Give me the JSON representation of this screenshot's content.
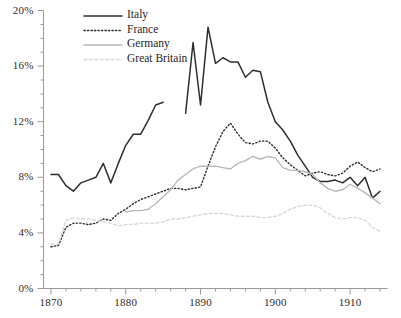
{
  "chart_data": {
    "type": "line",
    "title": "",
    "subtitle": "",
    "xlabel": "",
    "ylabel": "",
    "xlim": [
      1869,
      1915
    ],
    "ylim": [
      0,
      20
    ],
    "grid": false,
    "legend_position": "top-left",
    "y_ticks": [
      0,
      4,
      8,
      12,
      16,
      20
    ],
    "y_tick_labels": [
      "0%",
      "4%",
      "8%",
      "12%",
      "16%",
      "20%"
    ],
    "y_minor_step": 1,
    "x_ticks": [
      1870,
      1880,
      1890,
      1900,
      1910
    ],
    "x_tick_labels": [
      "1870",
      "1880",
      "1890",
      "1900",
      "1910"
    ],
    "x_minor_step": 2,
    "value_unit": "percent",
    "series": [
      {
        "name": "Italy",
        "color": "#2e2e2e",
        "style": "solid",
        "width": 1.5,
        "x": [
          1870,
          1871,
          1872,
          1873,
          1874,
          1875,
          1876,
          1877,
          1878,
          1879,
          1880,
          1881,
          1882,
          1883,
          1884,
          1885
        ],
        "values": [
          8.2,
          8.2,
          7.4,
          7.0,
          7.6,
          7.8,
          8.0,
          9.0,
          7.6,
          9.0,
          10.3,
          11.1,
          11.1,
          12.1,
          13.2,
          13.4
        ]
      },
      {
        "name": "Italy",
        "color": "#2e2e2e",
        "style": "solid",
        "width": 1.5,
        "segment": 2,
        "x": [
          1888,
          1889,
          1890,
          1891,
          1892,
          1893,
          1894,
          1895,
          1896,
          1897,
          1898,
          1899,
          1900,
          1901,
          1902,
          1903,
          1904,
          1905,
          1906,
          1907,
          1908,
          1909,
          1910,
          1911,
          1912,
          1913,
          1914
        ],
        "values": [
          12.6,
          17.7,
          13.2,
          18.8,
          16.2,
          16.6,
          16.3,
          16.3,
          15.2,
          15.7,
          15.6,
          13.4,
          12.0,
          11.4,
          10.6,
          9.6,
          8.8,
          8.0,
          7.7,
          7.7,
          7.8,
          7.6,
          8.0,
          7.4,
          8.0,
          6.5,
          7.0
        ]
      },
      {
        "name": "France",
        "color": "#2e2e2e",
        "style": "dotted",
        "width": 1.4,
        "x": [
          1870,
          1871,
          1872,
          1873,
          1874,
          1875,
          1876,
          1877,
          1878,
          1879,
          1880,
          1881,
          1882,
          1883,
          1884,
          1885,
          1886,
          1887,
          1888,
          1889,
          1890,
          1891,
          1892,
          1893,
          1894,
          1895,
          1896,
          1897,
          1898,
          1899,
          1900,
          1901,
          1902,
          1903,
          1904,
          1905,
          1906,
          1907,
          1908,
          1909,
          1910,
          1911,
          1912,
          1913,
          1914
        ],
        "values": [
          3.0,
          3.1,
          4.4,
          4.7,
          4.7,
          4.6,
          4.7,
          5.0,
          4.9,
          5.4,
          5.7,
          6.1,
          6.4,
          6.6,
          6.8,
          7.0,
          7.2,
          7.2,
          7.1,
          7.2,
          7.3,
          8.8,
          10.2,
          11.3,
          11.9,
          11.1,
          10.5,
          10.4,
          10.6,
          10.6,
          10.1,
          9.4,
          8.9,
          8.5,
          8.1,
          8.3,
          8.4,
          8.2,
          8.1,
          8.3,
          8.8,
          9.1,
          8.7,
          8.4,
          8.6
        ]
      },
      {
        "name": "Germany",
        "color": "#b9b9b9",
        "style": "solid",
        "width": 1.4,
        "x": [
          1880,
          1881,
          1882,
          1883,
          1884,
          1885,
          1886,
          1887,
          1888,
          1889,
          1890,
          1891,
          1892,
          1893,
          1894,
          1895,
          1896,
          1897,
          1898,
          1899,
          1900,
          1901,
          1902,
          1903,
          1904,
          1905,
          1906,
          1907,
          1908,
          1909,
          1910,
          1911,
          1912,
          1913,
          1914
        ],
        "values": [
          5.5,
          5.6,
          5.6,
          5.7,
          6.1,
          6.6,
          7.1,
          7.8,
          8.2,
          8.6,
          8.8,
          8.8,
          8.8,
          8.7,
          8.6,
          9.0,
          9.2,
          9.5,
          9.3,
          9.5,
          9.4,
          8.7,
          8.5,
          8.5,
          8.4,
          8.2,
          7.6,
          7.2,
          7.0,
          7.1,
          7.5,
          7.2,
          6.9,
          6.5,
          6.1
        ]
      },
      {
        "name": "Great Britain",
        "color": "#d9d9d9",
        "style": "dashed",
        "width": 1.4,
        "x": [
          1870,
          1871,
          1872,
          1873,
          1874,
          1875,
          1876,
          1877,
          1878,
          1879,
          1880,
          1881,
          1882,
          1883,
          1884,
          1885,
          1886,
          1887,
          1888,
          1889,
          1890,
          1891,
          1892,
          1893,
          1894,
          1895,
          1896,
          1897,
          1898,
          1899,
          1900,
          1901,
          1902,
          1903,
          1904,
          1905,
          1906,
          1907,
          1908,
          1909,
          1910,
          1911,
          1912,
          1913,
          1914
        ],
        "values": [
          3.2,
          3.2,
          4.9,
          5.1,
          5.0,
          5.0,
          4.9,
          4.8,
          4.7,
          4.5,
          4.6,
          4.6,
          4.7,
          4.7,
          4.7,
          4.8,
          5.0,
          5.0,
          5.1,
          5.2,
          5.3,
          5.4,
          5.4,
          5.4,
          5.3,
          5.2,
          5.2,
          5.2,
          5.1,
          5.1,
          5.2,
          5.4,
          5.7,
          5.9,
          6.0,
          6.0,
          5.8,
          5.4,
          5.1,
          5.0,
          5.1,
          5.1,
          4.9,
          4.4,
          4.1
        ]
      }
    ],
    "legend": [
      {
        "label": "Italy",
        "color": "#2e2e2e",
        "style": "solid"
      },
      {
        "label": "France",
        "color": "#2e2e2e",
        "style": "dotted"
      },
      {
        "label": "Germany",
        "color": "#b9b9b9",
        "style": "solid"
      },
      {
        "label": "Great Britain",
        "color": "#d9d9d9",
        "style": "dashed"
      }
    ],
    "axis_color": "#9a9a9a",
    "text_color": "#2b2b2b",
    "background": "#ffffff"
  }
}
